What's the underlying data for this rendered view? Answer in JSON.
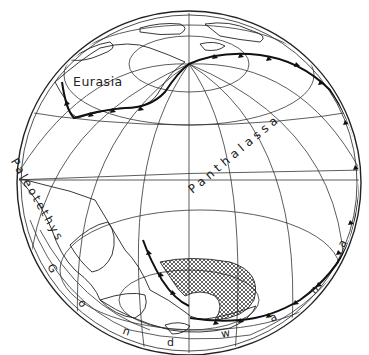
{
  "map": {
    "projection": "orthographic",
    "labels": {
      "eurasia": "Eurasia",
      "paleotethys": "Paleotethys",
      "panthalassa": "Panthalassa",
      "gondwana": "Gondwana"
    },
    "gondwana_letters": [
      "G",
      "o",
      "n",
      "d",
      "w",
      "a",
      "n",
      "a"
    ],
    "paleotethys_letters": [
      "P",
      "a",
      "l",
      "e",
      "o",
      "t",
      "e",
      "t",
      "h",
      "y",
      "s"
    ],
    "panthalassa_letters": [
      "P",
      "a",
      "n",
      "t",
      "h",
      "a",
      "l",
      "a",
      "s",
      "s",
      "a"
    ],
    "colors": {
      "ink": "#222222",
      "background": "#ffffff"
    }
  }
}
